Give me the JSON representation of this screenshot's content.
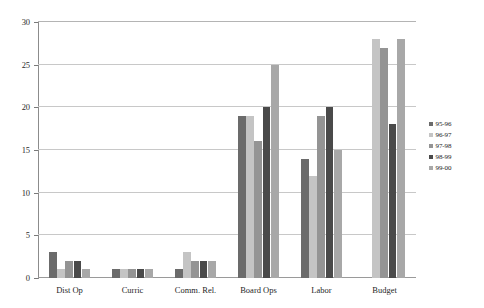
{
  "chart_data": {
    "type": "bar",
    "title": "",
    "xlabel": "",
    "ylabel": "",
    "ylim": [
      0,
      30
    ],
    "yticks": [
      0,
      5,
      10,
      15,
      20,
      25,
      30
    ],
    "grid": true,
    "legend_position": "right",
    "categories": [
      "Dist Op",
      "Curric",
      "Comm. Rel.",
      "Board Ops",
      "Labor",
      "Budget"
    ],
    "series": [
      {
        "name": "95-96",
        "color": "#6b6b6b",
        "values": [
          3,
          1,
          1,
          19,
          14,
          null
        ]
      },
      {
        "name": "96-97",
        "color": "#c4c4c4",
        "values": [
          1,
          1,
          3,
          19,
          12,
          28
        ]
      },
      {
        "name": "97-98",
        "color": "#949494",
        "values": [
          2,
          1,
          2,
          16,
          19,
          27
        ]
      },
      {
        "name": "98-99",
        "color": "#4a4a4a",
        "values": [
          2,
          1,
          2,
          20,
          20,
          18
        ]
      },
      {
        "name": "99-00",
        "color": "#a8a8a8",
        "values": [
          1,
          1,
          2,
          25,
          15,
          28
        ]
      }
    ]
  },
  "caption": {
    "text": ""
  },
  "axes": {
    "y_tick_labels": [
      "0",
      "5",
      "10",
      "15",
      "20",
      "25",
      "30"
    ]
  }
}
